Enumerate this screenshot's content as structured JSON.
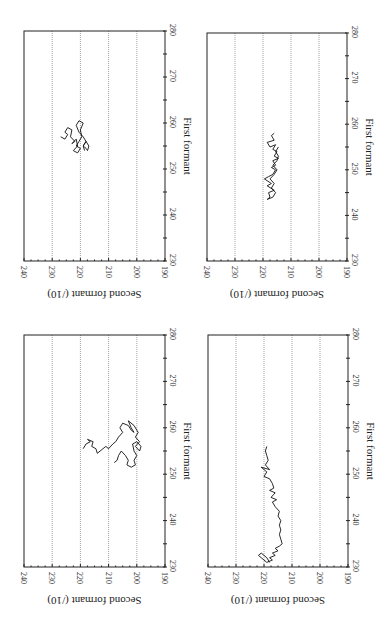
{
  "figure": {
    "rotation_deg": 90,
    "note_layout": "Figure printed rotated 90 degrees; first formant axis runs vertically on right side of each panel, second formant axis along bottom (reversed)."
  },
  "chart_data": [
    {
      "type": "line",
      "panel": "top-left",
      "title": "",
      "xlabel": "First formant",
      "ylabel": "Second formant (/10)",
      "xlim": [
        230,
        280
      ],
      "ylim": [
        190,
        240
      ],
      "xticks": [
        230,
        240,
        250,
        260,
        270,
        280
      ],
      "yticks": [
        190,
        200,
        210,
        220,
        230,
        240
      ],
      "grid": "horizontal dotted at 200, 210, 220, 230",
      "series": [
        {
          "name": "trajectory",
          "x": [
            257,
            256.5,
            257.5,
            258,
            259,
            258.5,
            257,
            256,
            255.5,
            256.5,
            255,
            254,
            253.5,
            254.5,
            255,
            256,
            257,
            258.5,
            260,
            260.5,
            259.5,
            258,
            257,
            256,
            255,
            254.5,
            254,
            255,
            256,
            255,
            254
          ],
          "y": [
            227,
            225.5,
            224.5,
            225.5,
            224.5,
            223,
            223.5,
            222,
            223,
            221.5,
            221,
            222.5,
            221,
            220,
            221.5,
            220.5,
            219.5,
            220,
            219,
            220.5,
            221.5,
            220.5,
            219,
            218,
            219,
            218,
            217.5,
            217,
            218,
            219,
            218.5
          ]
        }
      ]
    },
    {
      "type": "line",
      "panel": "top-right",
      "title": "",
      "xlabel": "First formant",
      "ylabel": "Second formant (/10)",
      "xlim": [
        230,
        280
      ],
      "ylim": [
        190,
        240
      ],
      "xticks": [
        230,
        240,
        250,
        260,
        270,
        280
      ],
      "yticks": [
        190,
        200,
        210,
        220,
        230,
        240
      ],
      "grid": "horizontal dotted at 200, 210, 220, 230",
      "series": [
        {
          "name": "trajectory",
          "x": [
            258,
            257.5,
            256.5,
            256,
            255,
            255.5,
            254.5,
            254,
            253,
            252.5,
            252,
            251,
            250.5,
            250,
            249,
            248.5,
            248,
            247,
            246.5,
            245.5,
            245,
            244,
            243.5,
            244,
            245,
            246,
            247,
            248,
            249,
            250,
            251,
            252,
            253,
            254,
            255
          ],
          "y": [
            216,
            217,
            216,
            218.5,
            217.5,
            215.5,
            216.5,
            215,
            216,
            214.5,
            216.5,
            215.5,
            217,
            215.5,
            216.5,
            218,
            219.5,
            217,
            218.5,
            216,
            218,
            217.5,
            218.5,
            216.5,
            215.5,
            217,
            216,
            217.5,
            216,
            215,
            216.5,
            215,
            214.5,
            215.5,
            214.5
          ]
        }
      ]
    },
    {
      "type": "line",
      "panel": "bottom-left",
      "title": "",
      "xlabel": "First formant",
      "ylabel": "Second formant (/10)",
      "xlim": [
        230,
        280
      ],
      "ylim": [
        190,
        240
      ],
      "xticks": [
        230,
        240,
        250,
        260,
        270,
        280
      ],
      "yticks": [
        190,
        200,
        210,
        220,
        230,
        240
      ],
      "grid": "horizontal dotted at 200, 210, 220, 230",
      "series": [
        {
          "name": "trajectory",
          "x": [
            255.5,
            256.5,
            257,
            257.5,
            257,
            256,
            255.5,
            254.5,
            255,
            255.5,
            256,
            255.5,
            256.5,
            257,
            258,
            259,
            260,
            261,
            260.5,
            259.5,
            259,
            260,
            261.5,
            260.5,
            259,
            258,
            257,
            256,
            255,
            256,
            257,
            256.5,
            255,
            254,
            253,
            252,
            251.5,
            252,
            253,
            254,
            255,
            254,
            253,
            252.5
          ],
          "y": [
            219,
            218,
            216.5,
            217.5,
            215.5,
            216,
            214.5,
            214,
            213,
            212,
            211,
            210,
            208.5,
            207.5,
            206.5,
            205,
            206,
            205,
            203,
            202,
            201,
            202,
            203,
            201,
            199.5,
            200.5,
            199,
            200.5,
            199,
            198.5,
            200,
            201.5,
            201,
            200,
            201,
            200.5,
            202,
            203.5,
            203,
            204,
            205.5,
            206.5,
            207,
            208
          ]
        }
      ]
    },
    {
      "type": "line",
      "panel": "bottom-right",
      "title": "",
      "xlabel": "First formant",
      "ylabel": "Second formant (/10)",
      "xlim": [
        230,
        280
      ],
      "ylim": [
        190,
        240
      ],
      "xticks": [
        230,
        240,
        250,
        260,
        270,
        280
      ],
      "yticks": [
        190,
        200,
        210,
        220,
        230,
        240
      ],
      "grid": "horizontal dotted at 200, 210, 220, 230",
      "series": [
        {
          "name": "trajectory",
          "x": [
            256,
            255,
            254,
            253,
            252,
            251,
            251.5,
            250.5,
            249.5,
            249,
            248,
            247,
            246.5,
            246,
            245,
            244.5,
            244,
            243,
            242,
            241,
            240,
            239,
            238,
            237,
            236,
            235,
            234.5,
            234,
            233.5,
            233,
            232.5,
            232,
            231.5,
            231,
            232,
            232.5,
            233,
            232,
            231
          ],
          "y": [
            219,
            219.5,
            219,
            218.5,
            219.5,
            218,
            221,
            219,
            220,
            218,
            217,
            216.5,
            218,
            216,
            217.5,
            215.5,
            217,
            216,
            214.5,
            215,
            214,
            214.5,
            214,
            214.5,
            214,
            213.5,
            214.5,
            216,
            215,
            217,
            216,
            218,
            217,
            219,
            221,
            222,
            221,
            219,
            218
          ]
        }
      ]
    }
  ],
  "axes_text": {
    "first_formant_label": "First formant",
    "second_formant_label": "Second formant (/10)",
    "first_formant_ticks": [
      "230",
      "240",
      "250",
      "260",
      "270",
      "280"
    ],
    "second_formant_ticks": [
      "240",
      "230",
      "220",
      "210",
      "200",
      "190"
    ]
  }
}
